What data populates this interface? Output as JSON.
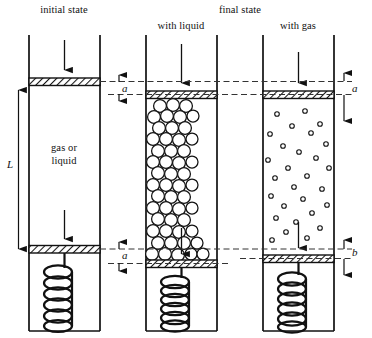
{
  "figure": {
    "type": "schematic"
  },
  "headings": {
    "initial_state": "initial state",
    "final_state": "final state"
  },
  "captions": {
    "with_liquid": "with liquid",
    "with_gas": "with gas"
  },
  "content_labels": {
    "gas_or_liquid_line1": "gas or",
    "gas_or_liquid_line2": "liquid"
  },
  "dimensions": {
    "length": "L",
    "top_gap_liquid": "a",
    "bottom_gap_liquid": "a",
    "top_gap_gas": "a",
    "bottom_gap_gas": "b"
  },
  "colors": {
    "ink": "#111111",
    "hatch": "#222222",
    "paper": "#ffffff",
    "dash": "#333333"
  },
  "panels": [
    {
      "id": "initial",
      "heading": "initial state",
      "fill": "gas or liquid",
      "top_piston_offset": 0,
      "bottom_piston_offset": 0,
      "particles": "none",
      "spring_state": "relaxed"
    },
    {
      "id": "final-liquid",
      "heading": "with liquid",
      "fill": "liquid",
      "top_piston_offset": "a",
      "bottom_piston_offset": "a",
      "particles": "large packed circles",
      "spring_state": "compressed"
    },
    {
      "id": "final-gas",
      "heading": "with gas",
      "fill": "gas",
      "top_piston_offset": "a",
      "bottom_piston_offset": "b",
      "particles": "small sparse circles",
      "spring_state": "relaxed"
    }
  ]
}
